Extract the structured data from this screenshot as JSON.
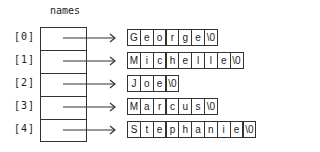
{
  "title": "names",
  "indices": [
    "[0]",
    "[1]",
    "[2]",
    "[3]",
    "[4]"
  ],
  "strings": [
    {
      "name": "George",
      "chars": [
        "G",
        "e",
        "o",
        "r",
        "g",
        "e",
        "\\0"
      ]
    },
    {
      "name": "Michelle",
      "chars": [
        "M",
        "i",
        "c",
        "h",
        "e",
        "l",
        "l",
        "e",
        "\\0"
      ]
    },
    {
      "name": "Joe",
      "chars": [
        "J",
        "o",
        "e",
        "\\0"
      ]
    },
    {
      "name": "Marcus",
      "chars": [
        "M",
        "a",
        "r",
        "c",
        "u",
        "s",
        "\\0"
      ]
    },
    {
      "name": "Stephanie",
      "chars": [
        "S",
        "t",
        "e",
        "p",
        "h",
        "a",
        "n",
        "i",
        "e",
        "\\0"
      ]
    }
  ]
}
